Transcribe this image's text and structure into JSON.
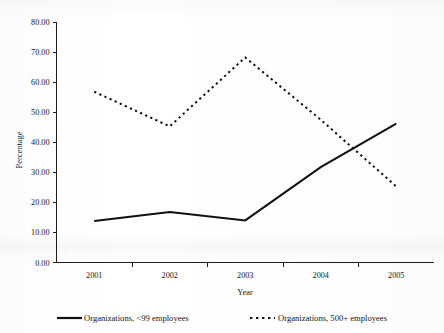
{
  "chart_data": {
    "type": "line",
    "title": "",
    "xlabel": "Year",
    "ylabel": "Percentage",
    "categories": [
      "2001",
      "2002",
      "2003",
      "2004",
      "2005"
    ],
    "x": [
      2001,
      2002,
      2003,
      2004,
      2005
    ],
    "ylim": [
      0,
      80
    ],
    "ytick_step": 10,
    "ytick_labels": [
      "0.00",
      "10.00",
      "20.00",
      "30.00",
      "40.00",
      "50.00",
      "60.00",
      "70.00",
      "80.00"
    ],
    "ytick_values": [
      0,
      10,
      20,
      30,
      40,
      50,
      60,
      70,
      80
    ],
    "grid": false,
    "legend_position": "bottom",
    "series": [
      {
        "name": "Organizations, <99 employees",
        "style": "solid",
        "color": "#101010",
        "values": [
          13.8,
          16.8,
          14.0,
          31.7,
          46.2
        ]
      },
      {
        "name": "Organizations, 500+ employees",
        "style": "dashed",
        "color": "#101010",
        "values": [
          56.8,
          45.3,
          68.2,
          47.5,
          25.3
        ]
      }
    ]
  },
  "legend": {
    "items": [
      {
        "label": "Organizations, <99 employees",
        "style": "solid"
      },
      {
        "label": "Organizations, 500+ employees",
        "style": "dashed"
      }
    ]
  },
  "axes": {
    "y_title": "Percentage",
    "x_title": "Year"
  }
}
